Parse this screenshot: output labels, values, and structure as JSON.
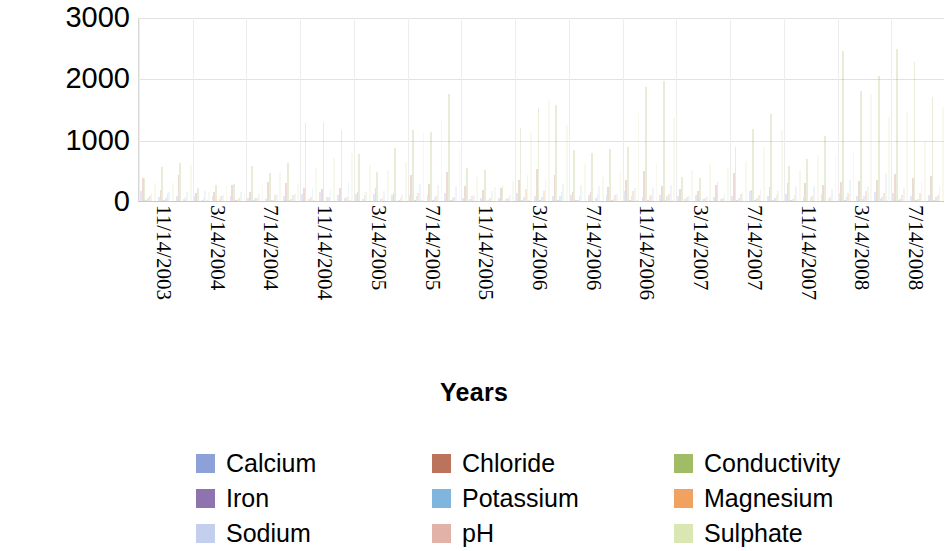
{
  "chart_data": {
    "type": "bar",
    "title": "",
    "subtitle": "",
    "xlabel": "Years",
    "ylabel": "Parameter test value",
    "ylim": [
      0,
      3000
    ],
    "yticks": [
      0,
      1000,
      2000,
      3000
    ],
    "ytick_labels": [
      "0",
      "1000",
      "2000",
      "3000"
    ],
    "grid": true,
    "grid_axis": "both",
    "legend_position": "bottom",
    "legend_columns": 3,
    "legend_rows": 3,
    "categories": [
      "11/14/2003",
      "3/14/2004",
      "7/14/2004",
      "11/14/2004",
      "3/14/2005",
      "7/14/2005",
      "11/14/2005",
      "3/14/2006",
      "7/14/2006",
      "11/14/2006",
      "3/14/2007",
      "7/14/2007",
      "11/14/2007",
      "3/14/2008",
      "7/14/2008"
    ],
    "series": [
      {
        "name": "Calcium",
        "color": "#7a8fd4",
        "values": [
          120,
          95,
          60,
          110,
          80,
          105,
          70,
          130,
          90,
          115,
          75,
          120,
          85,
          110,
          95
        ]
      },
      {
        "name": "Chloride",
        "color": "#b05a40",
        "values": [
          300,
          180,
          220,
          260,
          210,
          340,
          190,
          420,
          250,
          380,
          200,
          330,
          240,
          360,
          410
        ]
      },
      {
        "name": "Conductivity",
        "color": "#8fb24a",
        "values": [
          560,
          240,
          460,
          1050,
          620,
          1220,
          400,
          1980,
          700,
          1450,
          520,
          1060,
          760,
          1700,
          2050
        ]
      },
      {
        "name": "Iron",
        "color": "#7a5ba0",
        "values": [
          12,
          8,
          15,
          10,
          9,
          18,
          7,
          22,
          11,
          16,
          6,
          14,
          9,
          19,
          13
        ]
      },
      {
        "name": "Potassium",
        "color": "#6aa8d8",
        "values": [
          40,
          25,
          35,
          45,
          30,
          55,
          28,
          65,
          38,
          58,
          26,
          48,
          33,
          60,
          52
        ]
      },
      {
        "name": "Magnesium",
        "color": "#ef9244",
        "values": [
          90,
          60,
          75,
          95,
          70,
          110,
          65,
          140,
          85,
          120,
          58,
          100,
          78,
          130,
          115
        ]
      },
      {
        "name": "Sodium",
        "color": "#b8c7ea",
        "values": [
          200,
          130,
          170,
          240,
          160,
          280,
          140,
          340,
          190,
          300,
          150,
          260,
          180,
          320,
          290
        ]
      },
      {
        "name": "pH",
        "color": "#dda49a",
        "values": [
          7,
          7,
          7,
          8,
          7,
          8,
          7,
          8,
          7,
          8,
          7,
          8,
          7,
          8,
          8
        ]
      },
      {
        "name": "Sulphate",
        "color": "#d5e3a5",
        "values": [
          450,
          210,
          380,
          820,
          500,
          980,
          330,
          1180,
          560,
          1080,
          420,
          880,
          600,
          1230,
          1150
        ]
      }
    ]
  },
  "axes": {
    "y_title": "Parameter test value",
    "x_title": "Years",
    "y_tick_labels": [
      "3000",
      "2000",
      "1000",
      "0"
    ],
    "x_tick_labels": [
      "11/14/2003",
      "3/14/2004",
      "7/14/2004",
      "11/14/2004",
      "3/14/2005",
      "7/14/2005",
      "11/14/2005",
      "3/14/2006",
      "7/14/2006",
      "11/14/2006",
      "3/14/2007",
      "7/14/2007",
      "11/14/2007",
      "3/14/2008",
      "7/14/2008"
    ]
  },
  "legend": {
    "items": [
      {
        "label": "Calcium",
        "color": "#7a8fd4"
      },
      {
        "label": "Chloride",
        "color": "#b05a40"
      },
      {
        "label": "Conductivity",
        "color": "#8fb24a"
      },
      {
        "label": "Iron",
        "color": "#7a5ba0"
      },
      {
        "label": "Potassium",
        "color": "#6aa8d8"
      },
      {
        "label": "Magnesium",
        "color": "#ef9244"
      },
      {
        "label": "Sodium",
        "color": "#b8c7ea"
      },
      {
        "label": "pH",
        "color": "#dda49a"
      },
      {
        "label": "Sulphate",
        "color": "#d5e3a5"
      }
    ]
  },
  "style": {
    "plot_background": "#ffffff",
    "grid_color": "#e2e2e2",
    "axis_color": "#c9c9c9",
    "text_color": "#000000",
    "bar_opacity": 0.22
  }
}
